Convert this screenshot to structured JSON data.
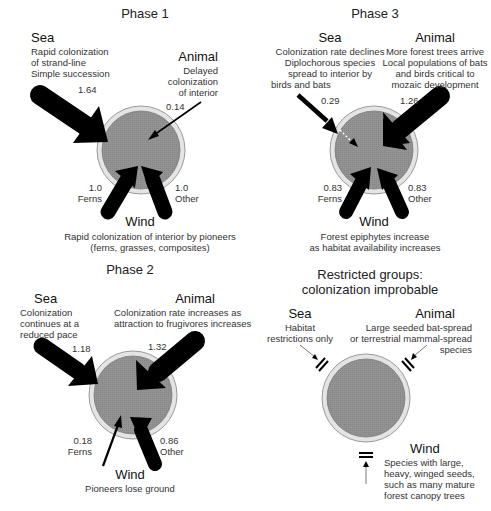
{
  "panels": {
    "phase1": {
      "title": "Phase 1",
      "sea": {
        "label": "Sea",
        "desc": [
          "Rapid colonization",
          "of strand-line",
          "Simple succession"
        ],
        "value": "1.64"
      },
      "animal": {
        "label": "Animal",
        "desc": [
          "Delayed",
          "colonization",
          "of interior"
        ],
        "value": "0.14"
      },
      "wind": {
        "label": "Wind",
        "desc": [
          "Rapid colonization of interior by pioneers",
          "(ferns, grasses, composites)"
        ],
        "ferns": {
          "value": "1.0",
          "label": "Ferns"
        },
        "other": {
          "value": "1.0",
          "label": "Other"
        }
      }
    },
    "phase2": {
      "title": "Phase 2",
      "sea": {
        "label": "Sea",
        "desc": [
          "Colonization",
          "continues at a",
          "reduced pace"
        ],
        "value": "1.18"
      },
      "animal": {
        "label": "Animal",
        "desc": [
          "Colonization rate increases as",
          "attraction to frugivores increases"
        ],
        "value": "1.32"
      },
      "wind": {
        "label": "Wind",
        "desc": [
          "Pioneers lose ground"
        ],
        "ferns": {
          "value": "0.18",
          "label": "Ferns"
        },
        "other": {
          "value": "0.86",
          "label": "Other"
        }
      }
    },
    "phase3": {
      "title": "Phase 3",
      "sea": {
        "label": "Sea",
        "desc": [
          "Colonization rate declines",
          "Diplochorous species",
          "spread to interior by",
          "birds and bats"
        ],
        "value": "0.29"
      },
      "animal": {
        "label": "Animal",
        "desc": [
          "More forest trees arrive",
          "Local populations of bats",
          "and birds critical to",
          "mozaic development"
        ],
        "value": "1.26"
      },
      "wind": {
        "label": "Wind",
        "desc": [
          "Forest epiphytes increase",
          "as habitat availability increases"
        ],
        "ferns": {
          "value": "0.83",
          "label": "Ferns"
        },
        "other": {
          "value": "0.83",
          "label": "Other"
        }
      }
    },
    "restricted": {
      "title": [
        "Restricted groups:",
        "colonization improbable"
      ],
      "sea": {
        "label": "Sea",
        "desc": [
          "Habitat",
          "restrictions only"
        ]
      },
      "animal": {
        "label": "Animal",
        "desc": [
          "Large seeded bat-spread",
          "or terrestrial mammal-spread",
          "species"
        ]
      },
      "wind": {
        "label": "Wind",
        "desc": [
          "Species with large,",
          "heavy, winged seeds,",
          "such as many mature",
          "forest canopy trees"
        ]
      }
    }
  },
  "colors": {
    "island_fill": "#8f8f8f",
    "island_ring": "#e2e2e2",
    "ring_stroke": "#9a9a9a",
    "arrow": "#000000",
    "text": "#222222"
  }
}
